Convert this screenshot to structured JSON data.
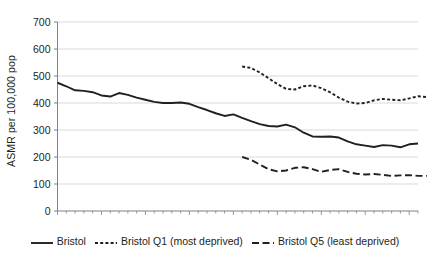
{
  "chart_data": {
    "type": "line",
    "title": "",
    "xlabel": "",
    "ylabel": "ASMR per 100,000 pop",
    "ylim": [
      0,
      700
    ],
    "ytick_labels": [
      "0",
      "100",
      "200",
      "300",
      "400",
      "500",
      "600",
      "700"
    ],
    "ytick_values": [
      0,
      100,
      200,
      300,
      400,
      500,
      600,
      700
    ],
    "grid": "horizontal",
    "legend_position": "bottom",
    "x_axis": {
      "labels_shown": false,
      "tick_count": 42,
      "minor_ticks": true
    },
    "series": [
      {
        "name": "Bristol",
        "style": "solid",
        "color": "#231f20",
        "x_start_index": 0,
        "values": [
          475,
          462,
          447,
          445,
          440,
          428,
          424,
          437,
          430,
          420,
          412,
          404,
          400,
          400,
          402,
          397,
          385,
          374,
          362,
          352,
          358,
          345,
          333,
          322,
          315,
          313,
          320,
          310,
          290,
          276,
          275,
          276,
          272,
          258,
          247,
          242,
          237,
          244,
          242,
          236,
          247,
          250
        ]
      },
      {
        "name": "Bristol Q1 (most deprived)",
        "style": "dotted",
        "color": "#231f20",
        "x_start_index": 21,
        "values": [
          535,
          530,
          513,
          492,
          470,
          452,
          450,
          462,
          465,
          455,
          440,
          420,
          405,
          398,
          400,
          410,
          415,
          412,
          410,
          417,
          425,
          422
        ]
      },
      {
        "name": "Bristol Q5 (least deprived)",
        "style": "dashed",
        "color": "#231f20",
        "x_start_index": 21,
        "values": [
          200,
          190,
          172,
          155,
          147,
          150,
          160,
          162,
          155,
          145,
          152,
          155,
          145,
          138,
          135,
          137,
          134,
          130,
          132,
          133,
          130,
          130
        ]
      }
    ]
  },
  "legend": {
    "items": [
      {
        "label": "Bristol",
        "style": "solid"
      },
      {
        "label": "Bristol Q1 (most deprived)",
        "style": "dotted"
      },
      {
        "label": "Bristol Q5 (least deprived)",
        "style": "dashed"
      }
    ]
  },
  "colors": {
    "ink": "#231f20",
    "grid": "#d9d9d9",
    "axis": "#808080"
  }
}
